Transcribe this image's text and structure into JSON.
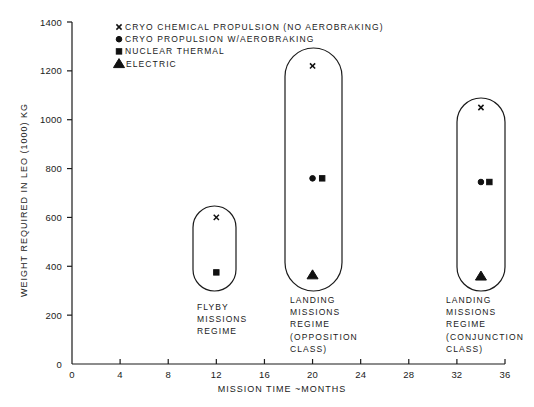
{
  "chart_data": {
    "type": "scatter",
    "title": "",
    "xlabel": "MISSION TIME ~MONTHS",
    "ylabel": "WEIGHT REQUIRED IN LEO (1000) KG",
    "xlim": [
      0,
      36
    ],
    "ylim": [
      0,
      1400
    ],
    "xticks": [
      0,
      4,
      8,
      12,
      16,
      20,
      24,
      28,
      32,
      36
    ],
    "yticks": [
      0,
      200,
      400,
      600,
      800,
      1000,
      1200,
      1400
    ],
    "grid": false,
    "legend_position": "upper-left inside",
    "legend": [
      {
        "marker": "x",
        "label": "CRYO CHEMICAL PROPULSION (NO AEROBRAKING)"
      },
      {
        "marker": "circle",
        "label": "CRYO PROPULSION W/AEROBRAKING"
      },
      {
        "marker": "square",
        "label": "NUCLEAR THERMAL"
      },
      {
        "marker": "triangle",
        "label": "ELECTRIC"
      }
    ],
    "series": [
      {
        "name": "CRYO CHEMICAL PROPULSION (NO AEROBRAKING)",
        "marker": "x",
        "points": [
          {
            "x": 12,
            "y": 600
          },
          {
            "x": 20,
            "y": 1220
          },
          {
            "x": 34,
            "y": 1050
          }
        ]
      },
      {
        "name": "CRYO PROPULSION W/AEROBRAKING",
        "marker": "circle",
        "points": [
          {
            "x": 20,
            "y": 760
          },
          {
            "x": 34,
            "y": 745
          }
        ]
      },
      {
        "name": "NUCLEAR THERMAL",
        "marker": "square",
        "points": [
          {
            "x": 12,
            "y": 375
          },
          {
            "x": 20.8,
            "y": 760
          },
          {
            "x": 34.7,
            "y": 745
          }
        ]
      },
      {
        "name": "ELECTRIC",
        "marker": "triangle",
        "points": [
          {
            "x": 20,
            "y": 365
          },
          {
            "x": 34,
            "y": 360
          }
        ]
      }
    ],
    "annotations": [
      {
        "group": "flyby",
        "lines": [
          "FLYBY",
          "MISSIONS",
          "REGIME"
        ],
        "enclosure": {
          "x_center": 12,
          "y_range": [
            315,
            650
          ]
        }
      },
      {
        "group": "opposition",
        "lines": [
          "LANDING",
          "MISSIONS",
          "REGIME",
          "(OPPOSITION",
          "CLASS)"
        ],
        "enclosure": {
          "x_center": 20.4,
          "y_range": [
            305,
            1295
          ]
        }
      },
      {
        "group": "conjunction",
        "lines": [
          "LANDING",
          "MISSIONS",
          "REGIME",
          "(CONJUNCTION",
          "CLASS)"
        ],
        "enclosure": {
          "x_center": 34.2,
          "y_range": [
            305,
            1090
          ]
        }
      }
    ]
  }
}
